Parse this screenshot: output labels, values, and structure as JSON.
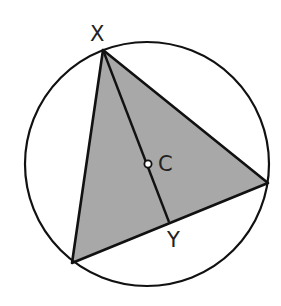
{
  "diagram": {
    "type": "geometry",
    "colors": {
      "stroke": "#111111",
      "fill": "#a8a8a8",
      "background": "#ffffff",
      "center_dot_fill": "#ffffff"
    },
    "circle": {
      "cx": 147,
      "cy": 164,
      "r": 122
    },
    "triangle": {
      "vertices": [
        {
          "name": "X",
          "x": 103,
          "y": 50
        },
        {
          "name": "left",
          "x": 72,
          "y": 263
        },
        {
          "name": "right",
          "x": 268,
          "y": 183
        }
      ]
    },
    "points": {
      "X": {
        "label": "X",
        "x": 103,
        "y": 50
      },
      "C": {
        "label": "C",
        "x": 148,
        "y": 164
      },
      "Y": {
        "label": "Y",
        "x": 169,
        "y": 222
      }
    },
    "labels": {
      "x_label": "X",
      "c_label": "C",
      "y_label": "Y"
    }
  }
}
